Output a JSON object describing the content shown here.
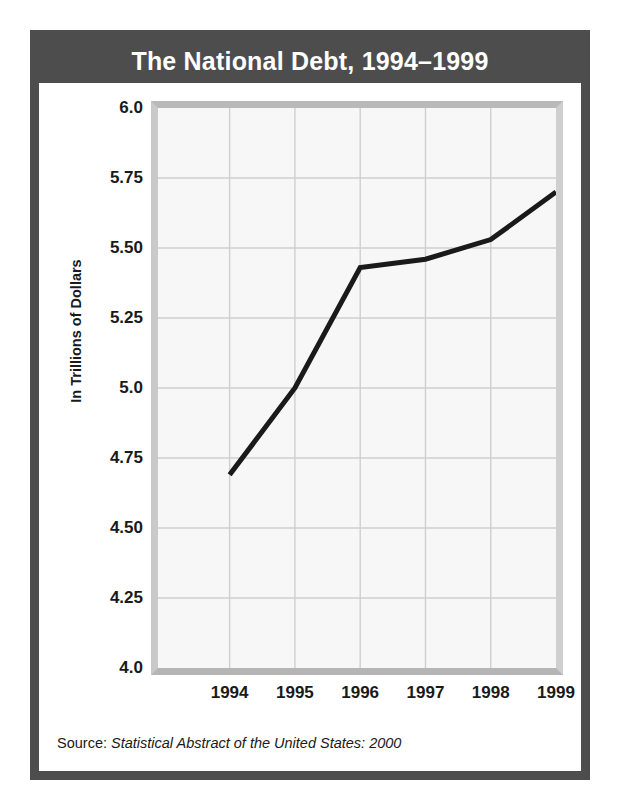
{
  "figure": {
    "title": "The National Debt, 1994–1999",
    "source_prefix": "Source: ",
    "source_reference": "Statistical Abstract of the United States: 2000"
  },
  "colors": {
    "frame": "#4d4d4d",
    "title_text": "#ffffff",
    "plot_background": "#f7f7f7",
    "grid": "#cfcfcf",
    "line": "#1a1a1a",
    "bevel": "#b9b9b9"
  },
  "chart_data": {
    "type": "line",
    "title": "The National Debt, 1994–1999",
    "subtitle": "",
    "xlabel": "",
    "ylabel": "In Trillions of Dollars",
    "categories": [
      "1994",
      "1995",
      "1996",
      "1997",
      "1998",
      "1999"
    ],
    "x": [
      1994,
      1995,
      1996,
      1997,
      1998,
      1999
    ],
    "values": [
      4.69,
      5.0,
      5.43,
      5.46,
      5.53,
      5.7
    ],
    "series": [
      {
        "name": "National Debt",
        "values": [
          4.69,
          5.0,
          5.43,
          5.46,
          5.53,
          5.7
        ]
      }
    ],
    "ylim": [
      4.0,
      6.0
    ],
    "xlim": [
      1994,
      1999
    ],
    "ytick_values": [
      4.0,
      4.25,
      4.5,
      4.75,
      5.0,
      5.25,
      5.5,
      5.75,
      6.0
    ],
    "ytick_labels": [
      "4.0",
      "4.25",
      "4.50",
      "4.75",
      "5.0",
      "5.25",
      "5.50",
      "5.75",
      "6.0"
    ],
    "xtick_labels": [
      "1994",
      "1995",
      "1996",
      "1997",
      "1998",
      "1999"
    ],
    "grid": true,
    "legend": false,
    "legend_position": "none",
    "annotations": []
  }
}
